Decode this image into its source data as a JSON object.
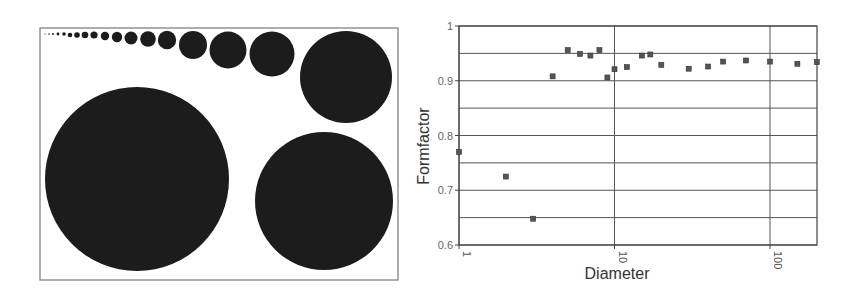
{
  "figure": {
    "left_panel": {
      "description": "Set of black discs of increasing diameter inside a rectangular frame",
      "frame": {
        "x": 40,
        "y": 28,
        "width": 358,
        "height": 252
      },
      "circle_color": "#1c1c1c",
      "circles": [
        {
          "cx": 45,
          "cy": 34,
          "r": 0.6
        },
        {
          "cx": 49,
          "cy": 34,
          "r": 0.8
        },
        {
          "cx": 53,
          "cy": 34,
          "r": 1.0
        },
        {
          "cx": 58,
          "cy": 34,
          "r": 1.4
        },
        {
          "cx": 64,
          "cy": 34,
          "r": 1.8
        },
        {
          "cx": 70,
          "cy": 35,
          "r": 2.3
        },
        {
          "cx": 77,
          "cy": 35,
          "r": 2.8
        },
        {
          "cx": 85,
          "cy": 35,
          "r": 3.3
        },
        {
          "cx": 94,
          "cy": 35,
          "r": 3.6
        },
        {
          "cx": 105,
          "cy": 36,
          "r": 4.2
        },
        {
          "cx": 117,
          "cy": 37,
          "r": 5.2
        },
        {
          "cx": 131,
          "cy": 38,
          "r": 6.5
        },
        {
          "cx": 148,
          "cy": 39,
          "r": 7.8
        },
        {
          "cx": 167,
          "cy": 40,
          "r": 9.2
        },
        {
          "cx": 193,
          "cy": 45,
          "r": 14
        },
        {
          "cx": 228,
          "cy": 50,
          "r": 18.5
        },
        {
          "cx": 272,
          "cy": 54,
          "r": 22.5
        },
        {
          "cx": 346,
          "cy": 77,
          "r": 46
        },
        {
          "cx": 137,
          "cy": 179,
          "r": 92
        },
        {
          "cx": 324,
          "cy": 201,
          "r": 69
        }
      ]
    },
    "right_panel": {
      "ylabel": "Formfactor",
      "xlabel": "Diameter",
      "y_tick_labels": [
        "1",
        "0.9",
        "0.8",
        "0.7",
        "0.6"
      ],
      "x_tick_labels": [
        "1",
        "10",
        "100"
      ]
    }
  },
  "chart_data": {
    "type": "scatter",
    "title": "",
    "xlabel": "Diameter",
    "ylabel": "Formfactor",
    "xscale": "log",
    "xlim": [
      1,
      200
    ],
    "ylim": [
      0.6,
      1.0
    ],
    "grid": {
      "horizontal": true,
      "vertical": true,
      "y_step": 0.05,
      "x_major": [
        1,
        10,
        100
      ]
    },
    "x_ticks": [
      1,
      10,
      100
    ],
    "y_ticks": [
      0.6,
      0.7,
      0.8,
      0.9,
      1.0
    ],
    "marker": "square",
    "marker_color": "#555555",
    "series": [
      {
        "name": "Formfactor vs Diameter",
        "points": [
          {
            "x": 1,
            "y": 0.77
          },
          {
            "x": 2,
            "y": 0.725
          },
          {
            "x": 3,
            "y": 0.648
          },
          {
            "x": 4,
            "y": 0.908
          },
          {
            "x": 5,
            "y": 0.956
          },
          {
            "x": 6,
            "y": 0.949
          },
          {
            "x": 7,
            "y": 0.946
          },
          {
            "x": 8,
            "y": 0.956
          },
          {
            "x": 9,
            "y": 0.906
          },
          {
            "x": 10,
            "y": 0.921
          },
          {
            "x": 12,
            "y": 0.925
          },
          {
            "x": 15,
            "y": 0.946
          },
          {
            "x": 17,
            "y": 0.948
          },
          {
            "x": 20,
            "y": 0.929
          },
          {
            "x": 30,
            "y": 0.922
          },
          {
            "x": 40,
            "y": 0.926
          },
          {
            "x": 50,
            "y": 0.935
          },
          {
            "x": 70,
            "y": 0.937
          },
          {
            "x": 100,
            "y": 0.935
          },
          {
            "x": 150,
            "y": 0.931
          },
          {
            "x": 200,
            "y": 0.934
          }
        ]
      }
    ]
  }
}
